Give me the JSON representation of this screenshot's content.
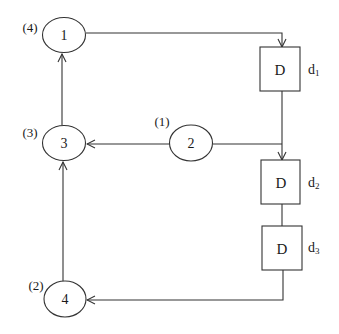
{
  "diagram": {
    "nodes": [
      {
        "id": "1",
        "label": "1",
        "order_label": "(4)"
      },
      {
        "id": "2",
        "label": "2",
        "order_label": "(1)"
      },
      {
        "id": "3",
        "label": "3",
        "order_label": "(3)"
      },
      {
        "id": "4",
        "label": "4",
        "order_label": "(2)"
      }
    ],
    "delays": [
      {
        "id": "d1",
        "label": "D",
        "name": "d",
        "subscript": "1"
      },
      {
        "id": "d2",
        "label": "D",
        "name": "d",
        "subscript": "2"
      },
      {
        "id": "d3",
        "label": "D",
        "name": "d",
        "subscript": "3"
      }
    ],
    "edges": [
      {
        "from": "1",
        "to": "d1"
      },
      {
        "from": "d1",
        "to": "d2"
      },
      {
        "from": "2",
        "to": "d2"
      },
      {
        "from": "2",
        "to": "3"
      },
      {
        "from": "d2",
        "to": "d3"
      },
      {
        "from": "d3",
        "to": "4"
      },
      {
        "from": "4",
        "to": "3"
      },
      {
        "from": "3",
        "to": "1"
      }
    ],
    "colors": {
      "stroke": "#333333",
      "text": "#1a1a1a",
      "background": "#ffffff"
    }
  }
}
